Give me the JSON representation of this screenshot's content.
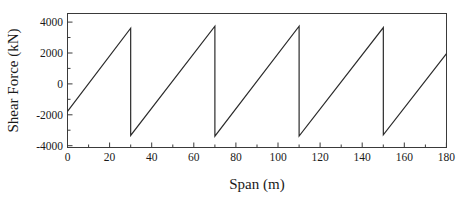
{
  "chart_data": {
    "type": "line",
    "title": "",
    "xlabel": "Span (m)",
    "ylabel": "Shear Force (kN)",
    "xlim": [
      0,
      180
    ],
    "ylim": [
      -5000,
      5000
    ],
    "xticks": [
      0,
      20,
      40,
      60,
      80,
      100,
      120,
      140,
      160,
      180
    ],
    "xtick_labels": [
      "0",
      "20",
      "40",
      "60",
      "80",
      "100",
      "120",
      "140",
      "160",
      "180"
    ],
    "yticks": [
      -4000,
      -2000,
      0,
      2000,
      4000
    ],
    "ytick_labels": [
      "-4000",
      "-2000",
      "0",
      "2000",
      "4000"
    ],
    "grid": false,
    "legend": null,
    "series": [
      {
        "name": "Shear Force Envelope",
        "x": [
          0,
          30,
          30,
          70,
          70,
          110,
          110,
          150,
          150,
          180
        ],
        "values": [
          -2300,
          3900,
          -4100,
          4050,
          -4150,
          4050,
          -4150,
          3950,
          -4050,
          2000
        ]
      }
    ]
  },
  "axes": {
    "x_axis_title": "Span (m)",
    "y_axis_title": "Shear Force (kN)"
  },
  "colors": {
    "line": "#2b2b2b",
    "frame": "#3a3a3a",
    "background": "#ffffff",
    "text": "#1a1a1a"
  }
}
